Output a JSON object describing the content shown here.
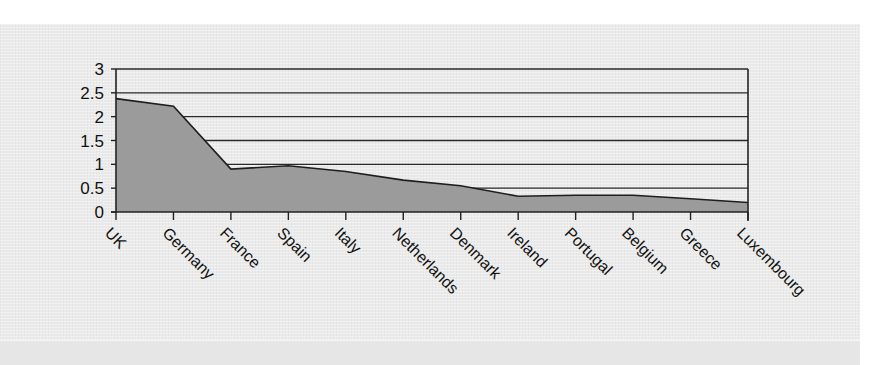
{
  "chart_data": {
    "type": "area",
    "title": "",
    "xlabel": "",
    "ylabel": "",
    "categories": [
      "UK",
      "Germany",
      "France",
      "Spain",
      "Italy",
      "Netherlands",
      "Denmark",
      "Ireland",
      "Portugal",
      "Belgium",
      "Greece",
      "Luxembourg"
    ],
    "series": [
      {
        "name": "Series 1",
        "values": [
          2.38,
          2.22,
          0.9,
          0.97,
          0.85,
          0.67,
          0.55,
          0.33,
          0.35,
          0.35,
          0.28,
          0.2
        ]
      }
    ],
    "ylim": [
      0,
      3
    ],
    "yticks": [
      "0",
      "0.5",
      "1",
      "1.5",
      "2",
      "2.5",
      "3"
    ],
    "grid": true,
    "legend": "none",
    "colors": {
      "fill": "#9b9b9b",
      "line": "#1e1e1e",
      "grid": "#2a2a2a",
      "panel": "#ebebeb"
    }
  }
}
